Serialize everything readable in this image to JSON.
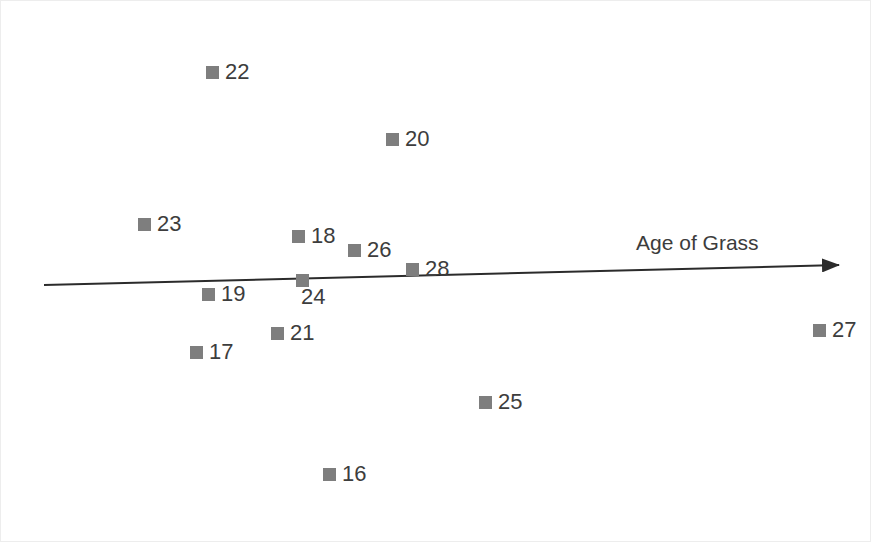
{
  "chart_data": {
    "type": "scatter",
    "title": "",
    "subtitle": "",
    "xlabel": "Age of Grass",
    "ylabel": "",
    "grid": false,
    "legend": null,
    "axis": {
      "x_axis_style": "arrow",
      "x_axis_direction": "increasing-right",
      "x_tick_labels": [],
      "y_tick_labels": [],
      "note": "Single slanted arrow axis labeled 'Age of Grass'; no numeric ticks shown"
    },
    "point_labels": [
      "22",
      "20",
      "23",
      "18",
      "26",
      "28",
      "19",
      "24",
      "21",
      "17",
      "27",
      "25",
      "16"
    ],
    "points": [
      {
        "label": "22",
        "x_px": 205,
        "y_px": 60,
        "label_pos": "right"
      },
      {
        "label": "20",
        "x_px": 385,
        "y_px": 127,
        "label_pos": "right"
      },
      {
        "label": "23",
        "x_px": 137,
        "y_px": 212,
        "label_pos": "right"
      },
      {
        "label": "18",
        "x_px": 291,
        "y_px": 224,
        "label_pos": "right"
      },
      {
        "label": "26",
        "x_px": 347,
        "y_px": 238,
        "label_pos": "right"
      },
      {
        "label": "28",
        "x_px": 405,
        "y_px": 257,
        "label_pos": "right"
      },
      {
        "label": "19",
        "x_px": 201,
        "y_px": 282,
        "label_pos": "right"
      },
      {
        "label": "24",
        "x_px": 295,
        "y_px": 273,
        "label_pos": "below"
      },
      {
        "label": "21",
        "x_px": 270,
        "y_px": 321,
        "label_pos": "right"
      },
      {
        "label": "17",
        "x_px": 189,
        "y_px": 340,
        "label_pos": "right"
      },
      {
        "label": "27",
        "x_px": 812,
        "y_px": 318,
        "label_pos": "right"
      },
      {
        "label": "25",
        "x_px": 478,
        "y_px": 390,
        "label_pos": "right"
      },
      {
        "label": "16",
        "x_px": 322,
        "y_px": 462,
        "label_pos": "right"
      }
    ],
    "marker_color": "#7e7e7e",
    "marker_shape": "square",
    "text_color": "#3d3d3d",
    "axis_color": "#2b2b2b",
    "background_color": "#ffffff"
  },
  "axis_label": {
    "text": "Age of Grass"
  }
}
